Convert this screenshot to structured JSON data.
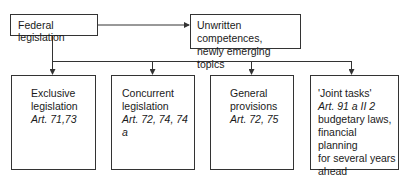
{
  "diagram": {
    "root": {
      "label": "Federal legislation"
    },
    "side": {
      "lines": [
        "Unwritten competences,",
        "newly emerging topics"
      ]
    },
    "children": [
      {
        "lines": [
          {
            "text": "Exclusive",
            "italic": false
          },
          {
            "text": "legislation",
            "italic": false
          },
          {
            "text": "Art. 71,73",
            "italic": true
          }
        ]
      },
      {
        "lines": [
          {
            "text": "Concurrent",
            "italic": false
          },
          {
            "text": "legislation",
            "italic": false
          },
          {
            "text": "Art. 72, 74, 74 a",
            "italic": true
          }
        ]
      },
      {
        "lines": [
          {
            "text": "General",
            "italic": false
          },
          {
            "text": "provisions",
            "italic": false
          },
          {
            "text": "Art. 72, 75",
            "italic": true
          }
        ]
      },
      {
        "lines": [
          {
            "text": "'Joint tasks'",
            "italic": false
          },
          {
            "text": "Art. 91 a II 2",
            "italic": true
          },
          {
            "text": "budgetary laws,",
            "italic": false
          },
          {
            "text": "financial planning",
            "italic": false
          },
          {
            "text": "for several years",
            "italic": false
          },
          {
            "text": "ahead",
            "italic": false
          },
          {
            "text": "Art. 109 III",
            "italic": false
          }
        ]
      }
    ],
    "colors": {
      "line": "#333333",
      "text": "#1a1a1a",
      "background": "#ffffff"
    }
  }
}
